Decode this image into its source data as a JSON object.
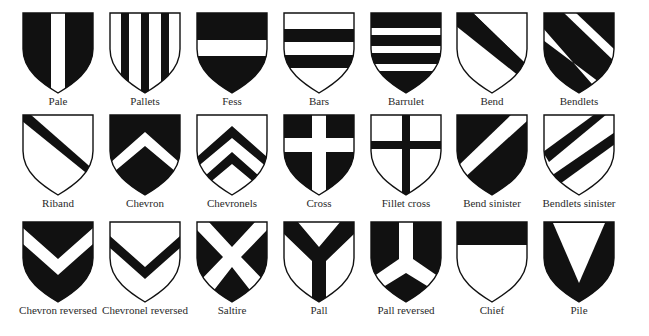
{
  "colors": {
    "ink": "#111111",
    "field": "#ffffff"
  },
  "rows": [
    [
      {
        "id": "pale",
        "label": "Pale"
      },
      {
        "id": "pallets",
        "label": "Pallets"
      },
      {
        "id": "fess",
        "label": "Fess"
      },
      {
        "id": "bars",
        "label": "Bars"
      },
      {
        "id": "barrulet",
        "label": "Barrulet"
      },
      {
        "id": "bend",
        "label": "Bend"
      },
      {
        "id": "bendlets",
        "label": "Bendlets"
      }
    ],
    [
      {
        "id": "riband",
        "label": "Riband"
      },
      {
        "id": "chevron",
        "label": "Chevron"
      },
      {
        "id": "chevronels",
        "label": "Chevronels"
      },
      {
        "id": "cross",
        "label": "Cross"
      },
      {
        "id": "fillet-cross",
        "label": "Fillet cross"
      },
      {
        "id": "bend-sinister",
        "label": "Bend sinister"
      },
      {
        "id": "bendlets-sinister",
        "label": "Bendlets sinister"
      }
    ],
    [
      {
        "id": "chevron-reversed",
        "label": "Chevron reversed"
      },
      {
        "id": "chevronel-reversed",
        "label": "Chevronel reversed"
      },
      {
        "id": "saltire",
        "label": "Saltire"
      },
      {
        "id": "pall",
        "label": "Pall"
      },
      {
        "id": "pall-reversed",
        "label": "Pall reversed"
      },
      {
        "id": "chief",
        "label": "Chief"
      },
      {
        "id": "pile",
        "label": "Pile"
      }
    ]
  ]
}
